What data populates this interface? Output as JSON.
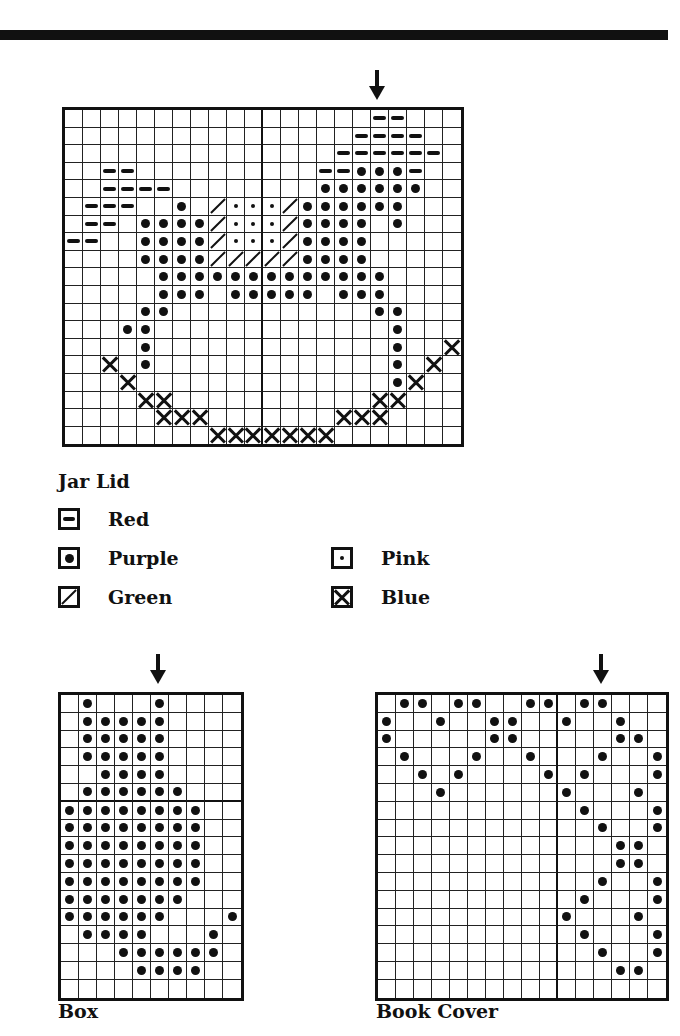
{
  "page": {
    "rule_color": "#111111"
  },
  "jar_lid": {
    "title": "Jar Lid",
    "cols": 22,
    "rows": 19,
    "arrow_col": 17,
    "center_col": 11,
    "cells": {
      "red": [
        [
          0,
          17
        ],
        [
          0,
          18
        ],
        [
          1,
          16
        ],
        [
          1,
          17
        ],
        [
          1,
          18
        ],
        [
          1,
          19
        ],
        [
          2,
          15
        ],
        [
          2,
          16
        ],
        [
          2,
          17
        ],
        [
          2,
          18
        ],
        [
          2,
          19
        ],
        [
          2,
          20
        ],
        [
          3,
          2
        ],
        [
          3,
          3
        ],
        [
          3,
          14
        ],
        [
          3,
          15
        ],
        [
          3,
          19
        ],
        [
          4,
          2
        ],
        [
          4,
          3
        ],
        [
          4,
          4
        ],
        [
          4,
          5
        ],
        [
          5,
          1
        ],
        [
          5,
          2
        ],
        [
          5,
          3
        ],
        [
          6,
          1
        ],
        [
          6,
          2
        ],
        [
          7,
          0
        ],
        [
          7,
          1
        ]
      ],
      "purple": [
        [
          3,
          16
        ],
        [
          3,
          17
        ],
        [
          3,
          18
        ],
        [
          4,
          14
        ],
        [
          4,
          15
        ],
        [
          4,
          16
        ],
        [
          4,
          17
        ],
        [
          4,
          18
        ],
        [
          4,
          19
        ],
        [
          5,
          6
        ],
        [
          5,
          13
        ],
        [
          5,
          14
        ],
        [
          5,
          15
        ],
        [
          5,
          16
        ],
        [
          5,
          17
        ],
        [
          5,
          18
        ],
        [
          6,
          4
        ],
        [
          6,
          5
        ],
        [
          6,
          6
        ],
        [
          6,
          7
        ],
        [
          6,
          13
        ],
        [
          6,
          14
        ],
        [
          6,
          15
        ],
        [
          6,
          16
        ],
        [
          6,
          18
        ],
        [
          7,
          4
        ],
        [
          7,
          5
        ],
        [
          7,
          6
        ],
        [
          7,
          7
        ],
        [
          7,
          13
        ],
        [
          7,
          14
        ],
        [
          7,
          15
        ],
        [
          7,
          16
        ],
        [
          8,
          4
        ],
        [
          8,
          5
        ],
        [
          8,
          6
        ],
        [
          8,
          7
        ],
        [
          8,
          13
        ],
        [
          8,
          14
        ],
        [
          8,
          15
        ],
        [
          8,
          16
        ],
        [
          9,
          5
        ],
        [
          9,
          6
        ],
        [
          9,
          7
        ],
        [
          9,
          8
        ],
        [
          9,
          9
        ],
        [
          9,
          10
        ],
        [
          9,
          11
        ],
        [
          9,
          12
        ],
        [
          9,
          13
        ],
        [
          9,
          14
        ],
        [
          9,
          15
        ],
        [
          9,
          16
        ],
        [
          9,
          17
        ],
        [
          10,
          5
        ],
        [
          10,
          6
        ],
        [
          10,
          7
        ],
        [
          10,
          9
        ],
        [
          10,
          10
        ],
        [
          10,
          11
        ],
        [
          10,
          12
        ],
        [
          10,
          13
        ],
        [
          10,
          15
        ],
        [
          10,
          16
        ],
        [
          10,
          17
        ],
        [
          11,
          4
        ],
        [
          11,
          5
        ],
        [
          11,
          17
        ],
        [
          11,
          18
        ],
        [
          12,
          3
        ],
        [
          12,
          4
        ],
        [
          12,
          18
        ],
        [
          13,
          4
        ],
        [
          13,
          18
        ],
        [
          14,
          4
        ],
        [
          14,
          18
        ],
        [
          15,
          18
        ]
      ],
      "pink": [
        [
          5,
          9
        ],
        [
          5,
          10
        ],
        [
          5,
          11
        ],
        [
          6,
          9
        ],
        [
          6,
          10
        ],
        [
          6,
          11
        ],
        [
          7,
          9
        ],
        [
          7,
          10
        ],
        [
          7,
          11
        ]
      ],
      "green": [
        [
          5,
          8
        ],
        [
          5,
          12
        ],
        [
          6,
          8
        ],
        [
          6,
          12
        ],
        [
          7,
          8
        ],
        [
          7,
          12
        ],
        [
          8,
          8
        ],
        [
          8,
          9
        ],
        [
          8,
          10
        ],
        [
          8,
          11
        ],
        [
          8,
          12
        ]
      ],
      "blue": [
        [
          13,
          21
        ],
        [
          14,
          2
        ],
        [
          14,
          20
        ],
        [
          15,
          3
        ],
        [
          15,
          19
        ],
        [
          16,
          4
        ],
        [
          16,
          5
        ],
        [
          16,
          17
        ],
        [
          16,
          18
        ],
        [
          17,
          5
        ],
        [
          17,
          6
        ],
        [
          17,
          7
        ],
        [
          17,
          15
        ],
        [
          17,
          16
        ],
        [
          17,
          17
        ],
        [
          18,
          8
        ],
        [
          18,
          9
        ],
        [
          18,
          10
        ],
        [
          18,
          11
        ],
        [
          18,
          12
        ],
        [
          18,
          13
        ],
        [
          18,
          14
        ]
      ]
    },
    "legend": [
      {
        "symbol": "red",
        "label": "Red"
      },
      {
        "symbol": "purple",
        "label": "Purple"
      },
      {
        "symbol": "green",
        "label": "Green"
      },
      {
        "symbol": "pink",
        "label": "Pink"
      },
      {
        "symbol": "blue",
        "label": "Blue"
      }
    ]
  },
  "box": {
    "title": "Box",
    "cols": 10,
    "rows": 17,
    "arrow_col": 5,
    "center_row": 6,
    "cells": {
      "purple": [
        [
          0,
          1
        ],
        [
          0,
          5
        ],
        [
          1,
          1
        ],
        [
          1,
          2
        ],
        [
          1,
          3
        ],
        [
          1,
          4
        ],
        [
          1,
          5
        ],
        [
          2,
          1
        ],
        [
          2,
          2
        ],
        [
          2,
          3
        ],
        [
          2,
          4
        ],
        [
          2,
          5
        ],
        [
          3,
          1
        ],
        [
          3,
          2
        ],
        [
          3,
          3
        ],
        [
          3,
          4
        ],
        [
          3,
          5
        ],
        [
          4,
          2
        ],
        [
          4,
          3
        ],
        [
          4,
          4
        ],
        [
          4,
          5
        ],
        [
          5,
          1
        ],
        [
          5,
          2
        ],
        [
          5,
          3
        ],
        [
          5,
          4
        ],
        [
          5,
          5
        ],
        [
          5,
          6
        ],
        [
          6,
          0
        ],
        [
          6,
          1
        ],
        [
          6,
          2
        ],
        [
          6,
          3
        ],
        [
          6,
          4
        ],
        [
          6,
          5
        ],
        [
          6,
          6
        ],
        [
          6,
          7
        ],
        [
          7,
          0
        ],
        [
          7,
          1
        ],
        [
          7,
          2
        ],
        [
          7,
          3
        ],
        [
          7,
          4
        ],
        [
          7,
          5
        ],
        [
          7,
          6
        ],
        [
          7,
          7
        ],
        [
          8,
          0
        ],
        [
          8,
          1
        ],
        [
          8,
          2
        ],
        [
          8,
          3
        ],
        [
          8,
          4
        ],
        [
          8,
          5
        ],
        [
          8,
          6
        ],
        [
          8,
          7
        ],
        [
          9,
          0
        ],
        [
          9,
          1
        ],
        [
          9,
          2
        ],
        [
          9,
          3
        ],
        [
          9,
          4
        ],
        [
          9,
          5
        ],
        [
          9,
          6
        ],
        [
          9,
          7
        ],
        [
          10,
          0
        ],
        [
          10,
          1
        ],
        [
          10,
          2
        ],
        [
          10,
          3
        ],
        [
          10,
          4
        ],
        [
          10,
          5
        ],
        [
          10,
          6
        ],
        [
          10,
          7
        ],
        [
          11,
          0
        ],
        [
          11,
          1
        ],
        [
          11,
          2
        ],
        [
          11,
          3
        ],
        [
          11,
          4
        ],
        [
          11,
          5
        ],
        [
          11,
          6
        ],
        [
          12,
          0
        ],
        [
          12,
          1
        ],
        [
          12,
          2
        ],
        [
          12,
          3
        ],
        [
          12,
          4
        ],
        [
          12,
          5
        ],
        [
          12,
          9
        ],
        [
          13,
          1
        ],
        [
          13,
          2
        ],
        [
          13,
          3
        ],
        [
          13,
          4
        ],
        [
          13,
          8
        ],
        [
          14,
          3
        ],
        [
          14,
          4
        ],
        [
          14,
          5
        ],
        [
          14,
          6
        ],
        [
          14,
          7
        ],
        [
          14,
          8
        ],
        [
          15,
          4
        ],
        [
          15,
          5
        ],
        [
          15,
          6
        ],
        [
          15,
          7
        ]
      ]
    }
  },
  "book_cover": {
    "title": "Book Cover",
    "cols": 16,
    "rows": 17,
    "arrow_col": 12,
    "center_col": 10,
    "cells": {
      "purple": [
        [
          0,
          1
        ],
        [
          0,
          2
        ],
        [
          0,
          4
        ],
        [
          0,
          5
        ],
        [
          0,
          8
        ],
        [
          0,
          9
        ],
        [
          0,
          11
        ],
        [
          0,
          12
        ],
        [
          1,
          0
        ],
        [
          1,
          3
        ],
        [
          1,
          6
        ],
        [
          1,
          7
        ],
        [
          1,
          10
        ],
        [
          1,
          13
        ],
        [
          2,
          0
        ],
        [
          2,
          6
        ],
        [
          2,
          7
        ],
        [
          2,
          13
        ],
        [
          2,
          14
        ],
        [
          3,
          1
        ],
        [
          3,
          5
        ],
        [
          3,
          8
        ],
        [
          3,
          12
        ],
        [
          3,
          15
        ],
        [
          4,
          2
        ],
        [
          4,
          4
        ],
        [
          4,
          9
        ],
        [
          4,
          11
        ],
        [
          4,
          15
        ],
        [
          5,
          3
        ],
        [
          5,
          10
        ],
        [
          5,
          14
        ],
        [
          6,
          11
        ],
        [
          6,
          15
        ],
        [
          7,
          12
        ],
        [
          7,
          15
        ],
        [
          8,
          13
        ],
        [
          8,
          14
        ],
        [
          9,
          13
        ],
        [
          9,
          14
        ],
        [
          10,
          12
        ],
        [
          10,
          15
        ],
        [
          11,
          11
        ],
        [
          11,
          15
        ],
        [
          12,
          10
        ],
        [
          12,
          14
        ],
        [
          13,
          11
        ],
        [
          13,
          15
        ],
        [
          14,
          12
        ],
        [
          14,
          15
        ],
        [
          15,
          13
        ],
        [
          15,
          14
        ]
      ]
    }
  }
}
